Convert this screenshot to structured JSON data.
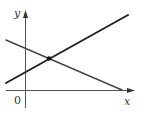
{
  "diagram": {
    "type": "coordinate-graph",
    "labels": {
      "y_axis": "y",
      "x_axis": "x",
      "origin": "0"
    },
    "colors": {
      "background": "#ffffff",
      "axes": "#555555",
      "line_increasing": "#222222",
      "line_decreasing": "#444444",
      "intersection_point": "#111111"
    },
    "elements": [
      {
        "name": "line-increasing",
        "description": "line with positive slope",
        "from": [
          6,
          83
        ],
        "to": [
          128,
          15
        ]
      },
      {
        "name": "line-decreasing",
        "description": "line with negative slope",
        "from": [
          6,
          40
        ],
        "to": [
          122,
          90
        ]
      },
      {
        "name": "intersection-point",
        "description": "point where the two lines intersect",
        "at": [
          49,
          58
        ]
      }
    ]
  }
}
